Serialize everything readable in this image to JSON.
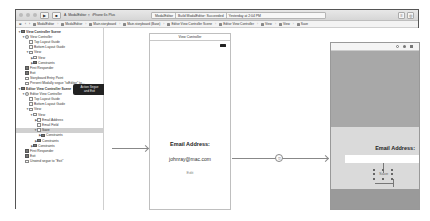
{
  "toolbar": {
    "run_icon": "play-icon",
    "stop_icon": "stop-icon",
    "scheme": "ModalEditor",
    "device": "iPhone 6s Plus",
    "status_project": "ModalEditor",
    "status_text": "Build ModalEditor: Succeeded",
    "status_time": "Yesterday at 2:04 PM"
  },
  "jumpbar": {
    "items": [
      "ModalEditor",
      "ModalEditor",
      "Main.storyboard",
      "Main.storyboard (Base)",
      "Editor View Controller Scene",
      "Editor View Controller",
      "View",
      "View",
      "Save"
    ]
  },
  "outline": {
    "rows": [
      {
        "label": "View Controller Scene",
        "indent": 0,
        "disc": "▼",
        "icon": "dark",
        "bold": true
      },
      {
        "label": "View Controller",
        "indent": 1,
        "disc": "▼",
        "icon": "circle"
      },
      {
        "label": "Top Layout Guide",
        "indent": 2,
        "disc": "",
        "icon": "plain"
      },
      {
        "label": "Bottom Layout Guide",
        "indent": 2,
        "disc": "",
        "icon": "plain"
      },
      {
        "label": "View",
        "indent": 2,
        "disc": "▼",
        "icon": "plain"
      },
      {
        "label": "View",
        "indent": 3,
        "disc": "▶",
        "icon": "plain"
      },
      {
        "label": "Constraints",
        "indent": 3,
        "disc": "▶",
        "icon": "dark"
      },
      {
        "label": "First Responder",
        "indent": 1,
        "disc": "",
        "icon": "dark"
      },
      {
        "label": "Exit",
        "indent": 1,
        "disc": "",
        "icon": "dark"
      },
      {
        "label": "Storyboard Entry Point",
        "indent": 1,
        "disc": "",
        "icon": "plain"
      },
      {
        "label": "Present Modally segue \"toEditor\" to...",
        "indent": 1,
        "disc": "",
        "icon": "plain"
      },
      {
        "label": "Editor View Controller Scene",
        "indent": 0,
        "disc": "▼",
        "icon": "dark",
        "bold": true
      },
      {
        "label": "Editor View Controller",
        "indent": 1,
        "disc": "▼",
        "icon": "circle"
      },
      {
        "label": "Top Layout Guide",
        "indent": 2,
        "disc": "",
        "icon": "plain"
      },
      {
        "label": "Bottom Layout Guide",
        "indent": 2,
        "disc": "",
        "icon": "plain"
      },
      {
        "label": "View",
        "indent": 2,
        "disc": "▼",
        "icon": "plain"
      },
      {
        "label": "View",
        "indent": 3,
        "disc": "▼",
        "icon": "plain"
      },
      {
        "label": "Email Address",
        "indent": 4,
        "disc": "▶",
        "icon": "plain"
      },
      {
        "label": "Email Field",
        "indent": 4,
        "disc": "",
        "icon": "plain"
      },
      {
        "label": "Save",
        "indent": 4,
        "disc": "▼",
        "icon": "plain",
        "selected": true
      },
      {
        "label": "Constraints",
        "indent": 5,
        "disc": "▶",
        "icon": "dark"
      },
      {
        "label": "Constraints",
        "indent": 4,
        "disc": "▶",
        "icon": "dark"
      },
      {
        "label": "Constraints",
        "indent": 3,
        "disc": "▶",
        "icon": "dark"
      },
      {
        "label": "First Responder",
        "indent": 1,
        "disc": "",
        "icon": "dark"
      },
      {
        "label": "Exit",
        "indent": 1,
        "disc": "",
        "icon": "dark"
      },
      {
        "label": "Unwind segue to \"Exit\"",
        "indent": 1,
        "disc": "",
        "icon": "plain"
      }
    ],
    "tooltip_line1": "Action Segue",
    "tooltip_line2": "and Exit"
  },
  "canvas": {
    "scene1": {
      "title": "View Controller",
      "email_label": "Email Address:",
      "email_value": "johnray@mac.com",
      "edit_label": "Edit"
    },
    "scene2": {
      "email_label": "Email Address:",
      "save_label": "Save"
    }
  }
}
